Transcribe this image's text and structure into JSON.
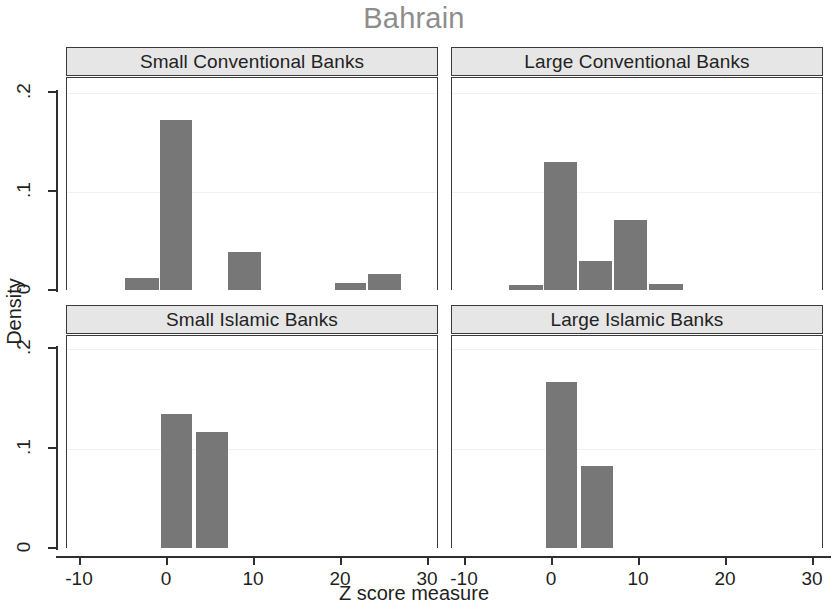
{
  "chart_data": {
    "type": "bar",
    "title": "Bahrain",
    "xlabel": "Z score measure",
    "ylabel": "Density",
    "layout": "2x2 panel histogram grid",
    "grid": false,
    "xlim": [
      -13,
      31
    ],
    "ylim": [
      0,
      0.21
    ],
    "xticks": [
      -10,
      0,
      10,
      20,
      30
    ],
    "xtick_labels": [
      "-10",
      "0",
      "10",
      "20",
      "30"
    ],
    "yticks": [
      0,
      0.1,
      0.2
    ],
    "ytick_labels": [
      "0",
      ".1",
      ".2"
    ],
    "bar_color": "#777777",
    "header_color": "#e6e6e6",
    "title_color": "#8d8d8d",
    "panels": [
      {
        "label": "Small Conventional Banks",
        "bins": [
          {
            "x0": -4.8,
            "x1": -0.8,
            "density": 0.012
          },
          {
            "x0": -0.8,
            "x1": 3.1,
            "density": 0.172
          },
          {
            "x0": 7.0,
            "x1": 11.0,
            "density": 0.038
          },
          {
            "x0": 19.3,
            "x1": 23.1,
            "density": 0.007
          },
          {
            "x0": 23.1,
            "x1": 27.1,
            "density": 0.016
          }
        ]
      },
      {
        "label": "Large Conventional Banks",
        "bins": [
          {
            "x0": -4.9,
            "x1": -0.9,
            "density": 0.005
          },
          {
            "x0": -0.9,
            "x1": 3.1,
            "density": 0.129
          },
          {
            "x0": 3.1,
            "x1": 7.1,
            "density": 0.029
          },
          {
            "x0": 7.1,
            "x1": 11.1,
            "density": 0.071
          },
          {
            "x0": 11.1,
            "x1": 15.2,
            "density": 0.006
          }
        ]
      },
      {
        "label": "Small Islamic Banks",
        "bins": [
          {
            "x0": -0.7,
            "x1": 3.1,
            "density": 0.134
          },
          {
            "x0": 3.3,
            "x1": 7.2,
            "density": 0.116
          }
        ]
      },
      {
        "label": "Large Islamic Banks",
        "bins": [
          {
            "x0": -0.7,
            "x1": 3.1,
            "density": 0.166
          },
          {
            "x0": 3.3,
            "x1": 7.2,
            "density": 0.082
          }
        ]
      }
    ]
  }
}
